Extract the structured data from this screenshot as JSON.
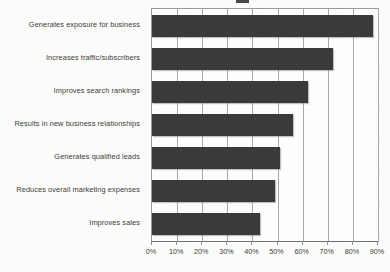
{
  "chart_data": {
    "type": "bar",
    "orientation": "horizontal",
    "title": "",
    "xlabel": "",
    "ylabel": "",
    "xlim": [
      0,
      90
    ],
    "grid": true,
    "legend": "none",
    "categories": [
      "Generates exposure for business",
      "Increases traffic/subscribers",
      "Improves search rankings",
      "Results in new business relationships",
      "Generates qualified leads",
      "Reduces overall marketing expenses",
      "Improves sales"
    ],
    "values": [
      88,
      72,
      62,
      56,
      51,
      49,
      43
    ],
    "value_unit": "%",
    "xticks": [
      0,
      10,
      20,
      30,
      40,
      50,
      60,
      70,
      80,
      90
    ],
    "xticklabels": [
      "0%",
      "10%",
      "20%",
      "30%",
      "40%",
      "50%",
      "60%",
      "70%",
      "80%",
      "90%"
    ],
    "bar_color": "#3a3a3a",
    "plot_background": "#fdfdfc",
    "gridline_color": "#a8a8a8",
    "axis_color": "#8d8d8d",
    "label_color": "#3b3b3b"
  }
}
